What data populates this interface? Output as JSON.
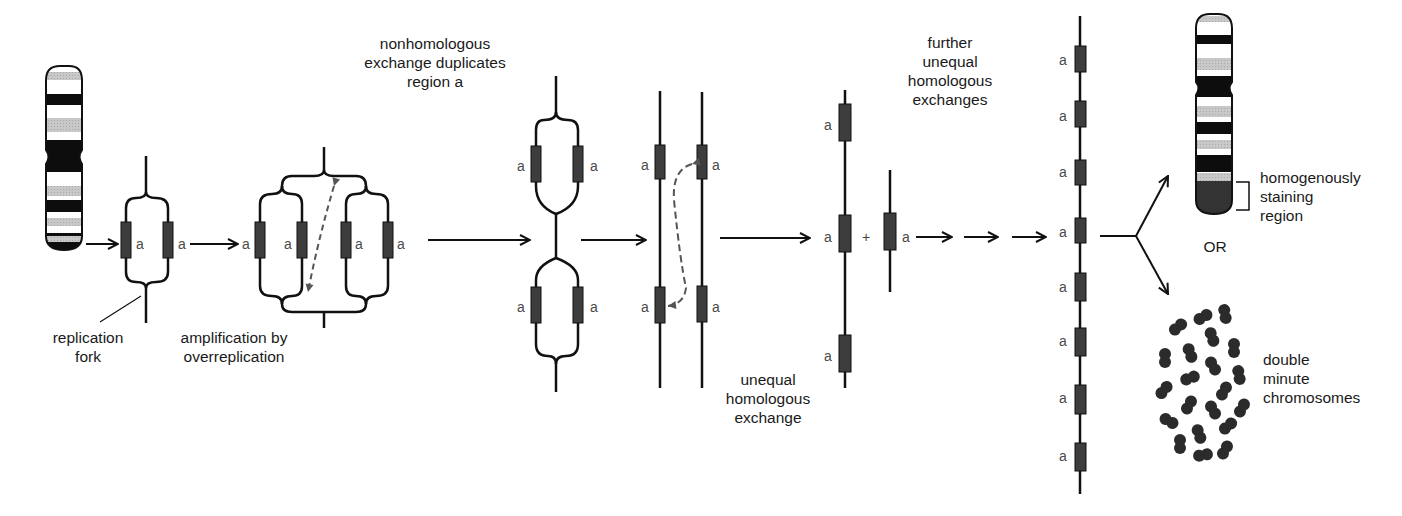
{
  "diagram": {
    "gene_label": "a",
    "colors": {
      "strand": "#111111",
      "gene_box": "#3d3d3d",
      "dashed_arrow": "#555555",
      "light_band": "#c4c4c4",
      "dark_band": "#0d0d0d",
      "hsr": "#333333",
      "double_minute": "#2b2b2b"
    },
    "labels": {
      "replication_fork": "replication fork",
      "replication_fork_l1": "replication",
      "replication_fork_l2": "fork",
      "amplification_l1": "amplification by",
      "amplification_l2": "overreplication",
      "nonhomologous_l1": "nonhomologous",
      "nonhomologous_l2": "exchange duplicates",
      "nonhomologous_l3": "region a",
      "unequal_l1": "unequal",
      "unequal_l2": "homologous",
      "unequal_l3": "exchange",
      "further_l1": "further",
      "further_l2": "unequal",
      "further_l3": "homologous",
      "further_l4": "exchanges",
      "hsr_l1": "homogenously",
      "hsr_l2": "staining",
      "hsr_l3": "region",
      "or": "OR",
      "dm_l1": "double",
      "dm_l2": "minute",
      "dm_l3": "chromosomes",
      "plus": "+"
    },
    "steps": [
      {
        "id": "chromosome",
        "description": "banded chromosome"
      },
      {
        "id": "replication_fork",
        "gene_copies": 2
      },
      {
        "id": "overreplication",
        "gene_copies": 4
      },
      {
        "id": "nonhomologous_exchange",
        "gene_copies": 4
      },
      {
        "id": "paired_strands",
        "gene_copies": 4
      },
      {
        "id": "unequal_exchange_products",
        "gene_copies": [
          3,
          1
        ]
      },
      {
        "id": "further_exchanges",
        "gene_copies": 8
      },
      {
        "id": "outcomes",
        "options": [
          "homogenously staining region",
          "double minute chromosomes"
        ]
      }
    ],
    "double_minute_count": 25
  }
}
